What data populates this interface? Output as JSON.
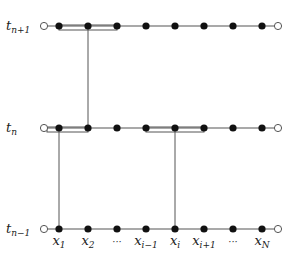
{
  "diagram": {
    "type": "time-space grid (numerical scheme stencil)",
    "rows": [
      {
        "id": "t_n+1",
        "label": "t",
        "subscript": "n+1",
        "y": 26
      },
      {
        "id": "t_n",
        "label": "t",
        "subscript": "n",
        "y": 128
      },
      {
        "id": "t_n-1",
        "label": "t",
        "subscript": "n−1",
        "y": 229
      }
    ],
    "columns": [
      {
        "label": "x",
        "subscript": "1",
        "x": 59,
        "show_label": true
      },
      {
        "label": "x",
        "subscript": "2",
        "x": 88,
        "show_label": true
      },
      {
        "label": "···",
        "subscript": "",
        "x": 117,
        "show_label": true
      },
      {
        "label": "x",
        "subscript": "i−1",
        "x": 146,
        "show_label": true
      },
      {
        "label": "x",
        "subscript": "i",
        "x": 175,
        "show_label": true
      },
      {
        "label": "x",
        "subscript": "i+1",
        "x": 204,
        "show_label": true
      },
      {
        "label": "···",
        "subscript": "",
        "x": 233,
        "show_label": true
      },
      {
        "label": "x",
        "subscript": "N",
        "x": 262,
        "show_label": true
      }
    ],
    "boundary_nodes": {
      "left_x": 44,
      "right_x": 278,
      "style": "open-circle"
    },
    "interior_nodes_style": "filled-circle",
    "boxes": [
      {
        "row": "t_n+1",
        "from_x": 59,
        "to_x": 117
      },
      {
        "row": "t_n",
        "from_x": 47,
        "to_x": 88
      },
      {
        "row": "t_n",
        "from_x": 146,
        "to_x": 204
      }
    ],
    "vertical_links": [
      {
        "x": 88,
        "from_row": "t_n+1",
        "to_row": "t_n"
      },
      {
        "x": 59,
        "from_row": "t_n",
        "to_row": "t_n-1"
      },
      {
        "x": 175,
        "from_row": "t_n",
        "to_row": "t_n-1"
      }
    ],
    "colors": {
      "line": "#555555",
      "node": "#111111",
      "background": "#ffffff"
    }
  }
}
